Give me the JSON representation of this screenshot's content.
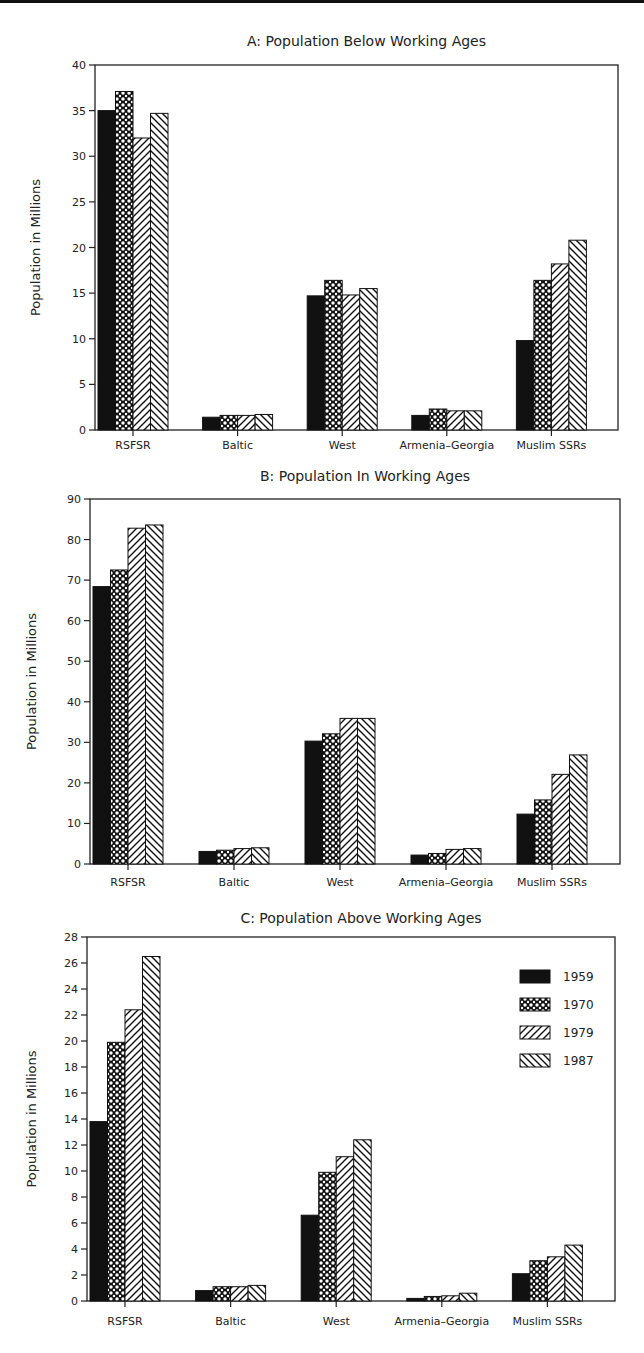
{
  "chart_data": [
    {
      "type": "bar",
      "title": "A: Population Below Working Ages",
      "xlabel": "",
      "ylabel": "Population in Millions",
      "ylim": [
        0,
        40
      ],
      "yticks": [
        0,
        5,
        10,
        15,
        20,
        25,
        30,
        35,
        40
      ],
      "categories": [
        "RSFSR",
        "Baltic",
        "West",
        "Armenia–Georgia",
        "Muslim SSRs"
      ],
      "series": [
        {
          "name": "1959",
          "values": [
            35.0,
            1.4,
            14.7,
            1.6,
            9.8
          ]
        },
        {
          "name": "1970",
          "values": [
            37.1,
            1.6,
            16.4,
            2.3,
            16.4
          ]
        },
        {
          "name": "1979",
          "values": [
            32.0,
            1.6,
            14.8,
            2.1,
            18.2
          ]
        },
        {
          "name": "1987",
          "values": [
            34.7,
            1.7,
            15.5,
            2.1,
            20.8
          ]
        }
      ],
      "grid": false,
      "legend": false
    },
    {
      "type": "bar",
      "title": "B: Population In Working Ages",
      "xlabel": "",
      "ylabel": "Population in Millions",
      "ylim": [
        0,
        90
      ],
      "yticks": [
        0,
        10,
        20,
        30,
        40,
        50,
        60,
        70,
        80,
        90
      ],
      "categories": [
        "RSFSR",
        "Baltic",
        "West",
        "Armenia–Georgia",
        "Muslim SSRs"
      ],
      "series": [
        {
          "name": "1959",
          "values": [
            68.4,
            3.1,
            30.3,
            2.2,
            12.3
          ]
        },
        {
          "name": "1970",
          "values": [
            72.5,
            3.4,
            32.1,
            2.6,
            15.8
          ]
        },
        {
          "name": "1979",
          "values": [
            82.8,
            3.8,
            35.9,
            3.6,
            22.1
          ]
        },
        {
          "name": "1987",
          "values": [
            83.6,
            4.0,
            35.9,
            3.8,
            26.9
          ]
        }
      ],
      "grid": false,
      "legend": false
    },
    {
      "type": "bar",
      "title": "C: Population Above Working Ages",
      "xlabel": "",
      "ylabel": "Population in Millions",
      "ylim": [
        0,
        28
      ],
      "yticks": [
        0,
        2,
        4,
        6,
        8,
        10,
        12,
        14,
        16,
        18,
        20,
        22,
        24,
        26,
        28
      ],
      "categories": [
        "RSFSR",
        "Baltic",
        "West",
        "Armenia–Georgia",
        "Muslim SSRs"
      ],
      "series": [
        {
          "name": "1959",
          "values": [
            13.8,
            0.8,
            6.6,
            0.2,
            2.1
          ]
        },
        {
          "name": "1970",
          "values": [
            19.9,
            1.1,
            9.9,
            0.35,
            3.1
          ]
        },
        {
          "name": "1979",
          "values": [
            22.4,
            1.1,
            11.1,
            0.4,
            3.4
          ]
        },
        {
          "name": "1987",
          "values": [
            26.5,
            1.2,
            12.4,
            0.6,
            4.3
          ]
        }
      ],
      "grid": false,
      "legend": true,
      "legend_position": "upper right",
      "legend_entries": [
        {
          "label": "1959",
          "pattern": "solid"
        },
        {
          "label": "1970",
          "pattern": "crosshatch"
        },
        {
          "label": "1979",
          "pattern": "diagonal-forward"
        },
        {
          "label": "1987",
          "pattern": "diagonal-backward"
        }
      ]
    }
  ],
  "colors": {
    "ink": "#111111",
    "background": "#ffffff"
  }
}
